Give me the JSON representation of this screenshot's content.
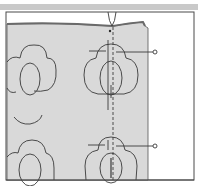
{
  "diagram": {
    "colors": {
      "background": "#ffffff",
      "top_band": "#c9c9c9",
      "frame_stroke": "#4a4a4a",
      "fabric_fill": "#d9d9d9",
      "fabric_fold_edge": "#7a7a7a",
      "line_stroke": "#3a3a3a"
    },
    "elements": {
      "frame": {
        "x": 6,
        "y": 12,
        "width": 188,
        "height": 168
      },
      "fabric_panel": {
        "x": 7,
        "y": 27,
        "width": 141,
        "height": 153
      },
      "center_fold_line": {
        "x": 113,
        "y1": 27,
        "y2": 180,
        "style": "dashed"
      },
      "needle": {
        "x": 111,
        "y1": 12,
        "y2": 27
      },
      "motifs": [
        {
          "id": "motif-left-top",
          "cx": 30,
          "cy": 80,
          "partial": true
        },
        {
          "id": "motif-center-top",
          "cx": 111,
          "cy": 78
        },
        {
          "id": "motif-left-bottom",
          "cx": 30,
          "cy": 170,
          "partial": true
        },
        {
          "id": "motif-center-bottom",
          "cx": 111,
          "cy": 168
        }
      ],
      "pins": [
        {
          "id": "pin-top",
          "x1": 87,
          "x2": 155,
          "y": 53,
          "head_x": 155
        },
        {
          "id": "pin-bottom",
          "x1": 87,
          "x2": 155,
          "y": 146,
          "head_x": 155
        }
      ]
    }
  }
}
